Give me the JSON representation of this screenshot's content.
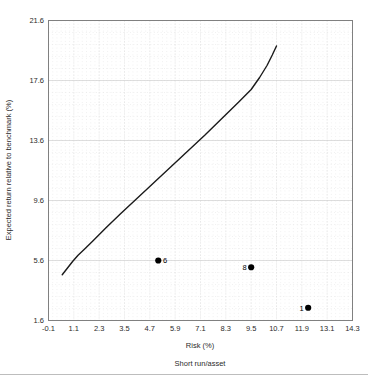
{
  "chart_data": {
    "type": "line",
    "title": "",
    "xlabel": "Risk (%)",
    "ylabel": "Expected return relative to benchmark (%)",
    "caption": "Short run/asset",
    "xlim": [
      -0.1,
      14.3
    ],
    "ylim": [
      1.6,
      21.6
    ],
    "xticks": [
      "-0.1",
      "1.1",
      "2.3",
      "3.5",
      "4.7",
      "5.9",
      "7.1",
      "8.3",
      "9.5",
      "10.7",
      "11.9",
      "13.1",
      "14.3"
    ],
    "xtick_values": [
      -0.1,
      1.1,
      2.3,
      3.5,
      4.7,
      5.9,
      7.1,
      8.3,
      9.5,
      10.7,
      11.9,
      13.1,
      14.3
    ],
    "yticks": [
      "1.6",
      "5.6",
      "9.6",
      "13.6",
      "17.6",
      "21.6"
    ],
    "ytick_values": [
      1.6,
      5.6,
      9.6,
      13.6,
      17.6,
      21.6
    ],
    "grid": true,
    "legend": "none",
    "series": [
      {
        "name": "efficient frontier",
        "type": "line",
        "color": "#1a1a1a",
        "x": [
          0.55,
          0.8,
          1.05,
          1.3,
          1.6,
          2.0,
          2.6,
          3.3,
          4.1,
          4.9,
          5.7,
          6.5,
          7.3,
          8.1,
          8.9,
          9.5,
          9.9,
          10.25,
          10.5,
          10.7
        ],
        "y": [
          4.65,
          5.1,
          5.55,
          5.95,
          6.35,
          6.9,
          7.75,
          8.7,
          9.75,
          10.8,
          11.85,
          12.9,
          13.95,
          15.05,
          16.15,
          17.0,
          17.8,
          18.6,
          19.3,
          19.9
        ]
      },
      {
        "name": "portfolios",
        "type": "scatter",
        "color": "#000000",
        "points": [
          {
            "label": "6",
            "x": 5.1,
            "y": 5.6,
            "label_side": "right"
          },
          {
            "label": "8",
            "x": 9.5,
            "y": 5.15,
            "label_side": "left"
          },
          {
            "label": "1",
            "x": 12.2,
            "y": 2.45,
            "label_side": "left"
          }
        ]
      }
    ]
  }
}
